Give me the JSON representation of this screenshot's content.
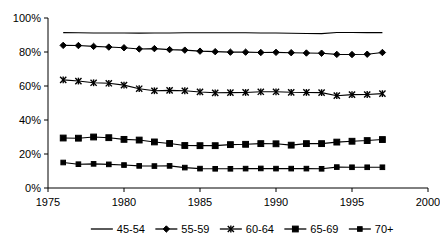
{
  "chart_data": {
    "type": "line",
    "title": "",
    "subtitle": "",
    "xlabel": "",
    "ylabel": "",
    "xlim": [
      1975,
      2000
    ],
    "ylim": [
      0,
      100
    ],
    "xticks": [
      1975,
      1980,
      1985,
      1990,
      1995,
      2000
    ],
    "xtick_labels": [
      "1975",
      "1980",
      "1985",
      "1990",
      "1995",
      "2000"
    ],
    "yticks": [
      0,
      20,
      40,
      60,
      80,
      100
    ],
    "ytick_labels": [
      "0%",
      "20%",
      "40%",
      "60%",
      "80%",
      "100%"
    ],
    "grid": false,
    "legend_position": "bottom",
    "x": [
      1976,
      1977,
      1978,
      1979,
      1980,
      1981,
      1982,
      1983,
      1984,
      1985,
      1986,
      1987,
      1988,
      1989,
      1990,
      1991,
      1992,
      1993,
      1994,
      1995,
      1996,
      1997
    ],
    "series": [
      {
        "name": "45-54",
        "marker": "none",
        "color": "#000000",
        "values": [
          91.4,
          91.3,
          91.2,
          91.2,
          91.2,
          91.1,
          91.2,
          91.2,
          91.3,
          91.3,
          91.3,
          91.3,
          91.3,
          91.2,
          91.2,
          91.0,
          90.9,
          90.8,
          91.5,
          91.5,
          91.4,
          91.4
        ]
      },
      {
        "name": "55-59",
        "marker": "diamond",
        "color": "#000000",
        "values": [
          83.9,
          83.8,
          83.3,
          82.9,
          82.5,
          81.8,
          82.0,
          81.4,
          81.1,
          80.5,
          80.2,
          79.9,
          79.9,
          79.7,
          79.8,
          79.6,
          79.4,
          79.3,
          78.6,
          78.5,
          78.7,
          79.7
        ]
      },
      {
        "name": "60-64",
        "marker": "x",
        "color": "#000000",
        "values": [
          63.6,
          62.9,
          61.9,
          61.6,
          60.5,
          58.4,
          57.2,
          57.4,
          57.2,
          56.5,
          56.0,
          56.1,
          56.2,
          56.6,
          56.6,
          56.3,
          56.2,
          56.1,
          54.3,
          54.9,
          55.0,
          55.5
        ]
      },
      {
        "name": "65-69",
        "marker": "square",
        "color": "#000000",
        "values": [
          29.4,
          29.3,
          30.0,
          29.6,
          28.6,
          28.2,
          27.1,
          26.2,
          25.0,
          24.9,
          24.9,
          25.5,
          25.7,
          26.1,
          26.0,
          25.2,
          26.1,
          26.1,
          27.0,
          27.5,
          27.9,
          28.5
        ]
      },
      {
        "name": "70+",
        "marker": "small-square",
        "color": "#000000",
        "values": [
          15.0,
          14.0,
          14.2,
          13.9,
          13.5,
          13.0,
          12.9,
          13.0,
          12.0,
          11.4,
          11.3,
          11.3,
          11.4,
          11.5,
          11.4,
          11.4,
          11.4,
          11.3,
          12.3,
          12.2,
          12.2,
          12.2
        ]
      }
    ],
    "legend": [
      {
        "label": "45-54",
        "marker": "none"
      },
      {
        "label": "55-59",
        "marker": "diamond"
      },
      {
        "label": "60-64",
        "marker": "x"
      },
      {
        "label": "65-69",
        "marker": "square"
      },
      {
        "label": "70+",
        "marker": "small-square"
      }
    ]
  }
}
